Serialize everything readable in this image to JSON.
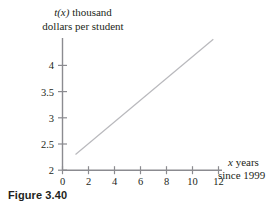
{
  "figure": {
    "caption": "Figure 3.40"
  },
  "axes": {
    "ylabel_line1_var": "t(x)",
    "ylabel_line1_rest": " thousand",
    "ylabel_line2": "dollars per student",
    "xlabel_line1_var": "x",
    "xlabel_line1_rest": " years",
    "xlabel_line2": "since 1999"
  },
  "chart_data": {
    "type": "line",
    "title": "",
    "xlabel": "x years since 1999",
    "ylabel": "t(x) thousand dollars per student",
    "xlim": [
      0,
      12
    ],
    "ylim": [
      2,
      4.6
    ],
    "xticks": [
      0,
      2,
      4,
      6,
      8,
      10,
      12
    ],
    "xtick_labels": [
      "0",
      "2",
      "4",
      "6",
      "8",
      "10",
      "12"
    ],
    "yticks": [
      2,
      2.5,
      3,
      3.5,
      4
    ],
    "ytick_labels": [
      "2",
      "2.5",
      "3",
      "3.5",
      "4"
    ],
    "grid": false,
    "legend": null,
    "series": [
      {
        "name": "t(x)",
        "color": "#b9b9bd",
        "x": [
          1,
          11.6
        ],
        "y": [
          2.3,
          4.5
        ],
        "slope": 0.2075,
        "intercept": 2.0925
      }
    ]
  },
  "colors": {
    "axis": "#8b8b90",
    "line": "#b9b9bd",
    "text": "#231f20"
  }
}
